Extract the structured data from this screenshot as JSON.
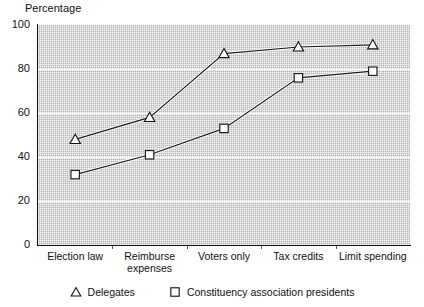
{
  "chart_data": {
    "type": "line",
    "title": "",
    "ylabel": "Percentage",
    "xlabel": "",
    "ylim": [
      0,
      100
    ],
    "yticks": [
      0,
      20,
      40,
      60,
      80,
      100
    ],
    "ytick_labels": [
      "0",
      "20",
      "40",
      "60",
      "80",
      "100"
    ],
    "grid": "horizontal",
    "legend_position": "bottom",
    "categories": [
      "Election law",
      "Reimburse\nexpenses",
      "Voters only",
      "Tax credits",
      "Limit spending"
    ],
    "category_labels": [
      "Election law",
      "Reimburse expenses",
      "Voters only",
      "Tax credits",
      "Limit spending"
    ],
    "series": [
      {
        "name": "Delegates",
        "marker": "triangle",
        "values": [
          48,
          58,
          87,
          90,
          91
        ]
      },
      {
        "name": "Constituency association presidents",
        "marker": "square",
        "values": [
          32,
          41,
          53,
          76,
          79
        ]
      }
    ],
    "colors": {
      "plot_background": "#b4b4b4",
      "gridline": "#ffffff",
      "axis": "#111111",
      "line": "#1a1a1a",
      "marker_fill": "#ffffff",
      "marker_edge": "#111111",
      "text": "#111111"
    }
  },
  "legend": {
    "entries": [
      {
        "marker": "triangle-marker-icon",
        "label": "Delegates"
      },
      {
        "marker": "square-marker-icon",
        "label": "Constituency association presidents"
      }
    ]
  }
}
